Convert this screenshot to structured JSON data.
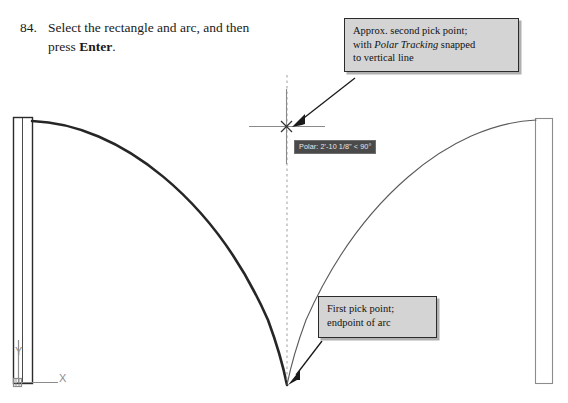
{
  "step": {
    "number": "84.",
    "text_before_bold": "Select the rectangle and arc, and then press ",
    "bold_word": "Enter",
    "text_after_bold": "."
  },
  "callouts": {
    "second_pick": {
      "line1": "Approx. second pick point;",
      "line2_before_italic": "with ",
      "line2_italic": "Polar Tracking",
      "line2_after_italic": " snapped",
      "line3": "to vertical line"
    },
    "first_pick": {
      "line1": "First pick point;",
      "line2": "endpoint of arc"
    }
  },
  "tooltip": {
    "text": "Polar: 2'-10 1/8\" < 90°"
  },
  "ucs_icon": {
    "y_label": "Y",
    "x_label": "X",
    "name": "ucs-coordinate-icon"
  },
  "drawing": {
    "left_rectangle_name": "left-vertical-rectangle",
    "right_rectangle_name": "right-vertical-rectangle",
    "left_arc_name": "left-arc-selected",
    "right_arc_name": "right-arc-mirrored",
    "tracking_line_name": "polar-tracking-vertical-line",
    "crosshair_name": "cursor-crosshair",
    "snap_marker_name": "endpoint-snap-marker"
  },
  "colors": {
    "line_dark": "#2b2b2b",
    "line_light": "#8c8c8c",
    "arc_thick": "#262626",
    "arc_thin": "#5a5a5a",
    "callout_fill": "#d4d4d4",
    "tooltip_bg": "#4a4a4a",
    "tooltip_text": "#e8e8e8",
    "tracking_line": "#a8a8a8",
    "background": "#ffffff"
  }
}
